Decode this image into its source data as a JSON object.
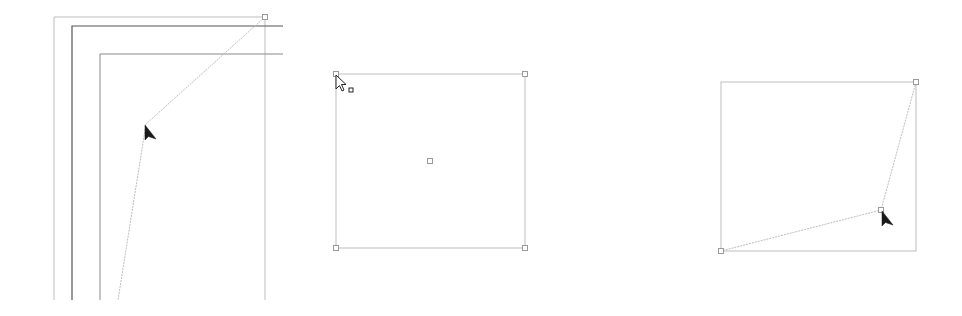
{
  "colors": {
    "background": "#ffffff",
    "light_line": "#bdbdbd",
    "dark_line": "#555555",
    "medium_line": "#8a8a8a",
    "handle_stroke": "#9a9a9a",
    "cursor_fill": "#1a1a1a"
  },
  "panels": [
    {
      "id": "panel-drag-corner-frames",
      "frames": [
        {
          "name": "outer-frame",
          "left": 54,
          "top": 17,
          "right": 265,
          "bottom": 300,
          "style": "light"
        },
        {
          "name": "page-frame",
          "left": 72,
          "top": 26,
          "right": 283,
          "bottom": 300,
          "style": "dark"
        },
        {
          "name": "inner-frame",
          "left": 100,
          "top": 54,
          "right": 283,
          "bottom": 300,
          "style": "medium"
        }
      ],
      "path_points": [
        [
          265,
          17
        ],
        [
          146,
          124
        ],
        [
          118,
          300
        ]
      ],
      "handle": [
        265,
        17
      ],
      "cursor": {
        "type": "arrow-filled",
        "x": 145,
        "y": 125
      }
    },
    {
      "id": "panel-selected-rectangle",
      "rect": {
        "left": 336,
        "top": 74,
        "right": 525,
        "bottom": 248
      },
      "handles": [
        [
          336,
          74
        ],
        [
          525,
          74
        ],
        [
          336,
          248
        ],
        [
          525,
          248
        ],
        [
          430,
          161
        ]
      ],
      "cursor": {
        "type": "arrow-outline-with-square",
        "x": 336,
        "y": 75
      }
    },
    {
      "id": "panel-distorted-shape",
      "rect": {
        "left": 721,
        "top": 82,
        "right": 916,
        "bottom": 251
      },
      "path_points": [
        [
          916,
          82
        ],
        [
          881,
          210
        ],
        [
          721,
          251
        ]
      ],
      "handles": [
        [
          916,
          82
        ],
        [
          881,
          210
        ],
        [
          721,
          251
        ]
      ],
      "cursor": {
        "type": "arrow-filled",
        "x": 882,
        "y": 211
      }
    }
  ]
}
